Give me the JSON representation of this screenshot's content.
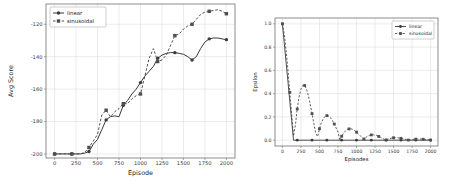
{
  "figure": {
    "background": "#ffffff",
    "grid_color": "#d9d9d9",
    "spine_color": "#707070",
    "tick_color": "#3a3a3a",
    "label_color": "#222222"
  },
  "chart_data": [
    {
      "name": "avg-score-chart",
      "type": "line",
      "title": "",
      "xlabel": "Episode",
      "ylabel": "Avg Score",
      "xlim": [
        -100,
        2100
      ],
      "ylim": [
        -202.5,
        -107.5
      ],
      "grid": true,
      "legend_position": "upper-left",
      "xticks": [
        0,
        250,
        500,
        750,
        1000,
        1250,
        1500,
        1750,
        2000
      ],
      "xtick_labels": [
        "0",
        "250",
        "500",
        "750",
        "1000",
        "1250",
        "1500",
        "1750",
        "2000"
      ],
      "yticks": [
        -200,
        -180,
        -160,
        -140,
        -120
      ],
      "ytick_labels": [
        "-200",
        "-180",
        "-160",
        "-140",
        "-120"
      ],
      "series": [
        {
          "name": "linear",
          "color": "#3a3a3a",
          "dash": "",
          "marker": "circle",
          "points": [
            [
              0,
              -200
            ],
            [
              50,
              -200
            ],
            [
              100,
              -200
            ],
            [
              150,
              -200
            ],
            [
              200,
              -200
            ],
            [
              250,
              -200
            ],
            [
              300,
              -200
            ],
            [
              350,
              -199.5
            ],
            [
              400,
              -198.5
            ],
            [
              450,
              -194
            ],
            [
              500,
              -191
            ],
            [
              550,
              -185
            ],
            [
              600,
              -179
            ],
            [
              650,
              -177
            ],
            [
              700,
              -176.5
            ],
            [
              750,
              -177
            ],
            [
              800,
              -170
            ],
            [
              850,
              -167
            ],
            [
              900,
              -163
            ],
            [
              950,
              -160
            ],
            [
              1000,
              -156
            ],
            [
              1050,
              -152
            ],
            [
              1100,
              -149
            ],
            [
              1150,
              -146
            ],
            [
              1200,
              -141
            ],
            [
              1250,
              -139
            ],
            [
              1300,
              -138
            ],
            [
              1350,
              -137.5
            ],
            [
              1400,
              -137.5
            ],
            [
              1450,
              -138
            ],
            [
              1500,
              -138.5
            ],
            [
              1550,
              -140
            ],
            [
              1600,
              -142
            ],
            [
              1650,
              -140
            ],
            [
              1700,
              -135
            ],
            [
              1750,
              -131
            ],
            [
              1800,
              -129
            ],
            [
              1850,
              -128.5
            ],
            [
              1900,
              -128.5
            ],
            [
              1950,
              -129
            ],
            [
              2000,
              -129.5
            ]
          ],
          "markers": [
            [
              0,
              -200
            ],
            [
              200,
              -200
            ],
            [
              400,
              -198.5
            ],
            [
              600,
              -179
            ],
            [
              800,
              -170
            ],
            [
              1000,
              -156
            ],
            [
              1200,
              -141
            ],
            [
              1400,
              -137.5
            ],
            [
              1600,
              -142
            ],
            [
              1800,
              -129
            ],
            [
              2000,
              -129.5
            ]
          ]
        },
        {
          "name": "sinusoidal",
          "color": "#4f4f4f",
          "dash": "2.6,1.8",
          "marker": "square",
          "points": [
            [
              0,
              -200
            ],
            [
              50,
              -200
            ],
            [
              100,
              -200
            ],
            [
              150,
              -200
            ],
            [
              200,
              -200
            ],
            [
              250,
              -200
            ],
            [
              300,
              -200
            ],
            [
              350,
              -199
            ],
            [
              400,
              -196
            ],
            [
              450,
              -192
            ],
            [
              500,
              -188
            ],
            [
              550,
              -176
            ],
            [
              600,
              -173
            ],
            [
              650,
              -177
            ],
            [
              700,
              -174
            ],
            [
              750,
              -172
            ],
            [
              800,
              -169
            ],
            [
              850,
              -169
            ],
            [
              900,
              -166
            ],
            [
              950,
              -164
            ],
            [
              1000,
              -163
            ],
            [
              1050,
              -152
            ],
            [
              1100,
              -141
            ],
            [
              1150,
              -135
            ],
            [
              1200,
              -143
            ],
            [
              1250,
              -142
            ],
            [
              1300,
              -139
            ],
            [
              1350,
              -133
            ],
            [
              1400,
              -127
            ],
            [
              1450,
              -126
            ],
            [
              1500,
              -123
            ],
            [
              1550,
              -121
            ],
            [
              1600,
              -120
            ],
            [
              1650,
              -117
            ],
            [
              1700,
              -114
            ],
            [
              1750,
              -112.5
            ],
            [
              1800,
              -112
            ],
            [
              1850,
              -111.5
            ],
            [
              1900,
              -111
            ],
            [
              1950,
              -112
            ],
            [
              2000,
              -113.5
            ]
          ],
          "markers": [
            [
              0,
              -200
            ],
            [
              200,
              -200
            ],
            [
              400,
              -196
            ],
            [
              600,
              -173
            ],
            [
              800,
              -169
            ],
            [
              1000,
              -163
            ],
            [
              1200,
              -143
            ],
            [
              1400,
              -127
            ],
            [
              1600,
              -120
            ],
            [
              1800,
              -112
            ],
            [
              2000,
              -113.5
            ]
          ]
        }
      ]
    },
    {
      "name": "epsilon-chart",
      "type": "line",
      "title": "",
      "xlabel": "Episodes",
      "ylabel": "Epsilon",
      "xlim": [
        -100,
        2100
      ],
      "ylim": [
        -0.05,
        1.05
      ],
      "grid": true,
      "legend_position": "upper-right",
      "xticks": [
        0,
        250,
        500,
        750,
        1000,
        1250,
        1500,
        1750,
        2000
      ],
      "xtick_labels": [
        "0",
        "250",
        "500",
        "750",
        "1000",
        "1250",
        "1500",
        "1750",
        "2000"
      ],
      "yticks": [
        0.0,
        0.2,
        0.4,
        0.6,
        0.8,
        1.0
      ],
      "ytick_labels": [
        "0.0",
        "0.2",
        "0.4",
        "0.6",
        "0.8",
        "1.0"
      ],
      "series": [
        {
          "name": "linear",
          "color": "#3a3a3a",
          "dash": "",
          "marker": "circle",
          "points": [
            [
              0,
              1.0
            ],
            [
              25,
              0.833
            ],
            [
              50,
              0.667
            ],
            [
              75,
              0.5
            ],
            [
              100,
              0.333
            ],
            [
              125,
              0.167
            ],
            [
              150,
              0
            ],
            [
              2000,
              0
            ]
          ],
          "markers": [
            [
              0,
              1.0
            ],
            [
              200,
              0
            ],
            [
              400,
              0
            ],
            [
              600,
              0
            ],
            [
              800,
              0
            ],
            [
              1000,
              0
            ],
            [
              1200,
              0
            ],
            [
              1400,
              0
            ],
            [
              1600,
              0
            ],
            [
              1800,
              0
            ],
            [
              2000,
              0
            ]
          ]
        },
        {
          "name": "sinusoidal",
          "color": "#4f4f4f",
          "dash": "2.2,1.6",
          "marker": "square",
          "points": [
            [
              0,
              1.0
            ],
            [
              25,
              0.909
            ],
            [
              50,
              0.771
            ],
            [
              75,
              0.6
            ],
            [
              100,
              0.411
            ],
            [
              125,
              0.22
            ],
            [
              150,
              0.035
            ],
            [
              175,
              0.129
            ],
            [
              200,
              0.268
            ],
            [
              225,
              0.372
            ],
            [
              250,
              0.439
            ],
            [
              275,
              0.472
            ],
            [
              300,
              0.47
            ],
            [
              325,
              0.439
            ],
            [
              350,
              0.384
            ],
            [
              375,
              0.311
            ],
            [
              400,
              0.228
            ],
            [
              425,
              0.142
            ],
            [
              450,
              0.057
            ],
            [
              475,
              0.031
            ],
            [
              500,
              0.099
            ],
            [
              525,
              0.15
            ],
            [
              550,
              0.184
            ],
            [
              575,
              0.204
            ],
            [
              600,
              0.211
            ],
            [
              625,
              0.207
            ],
            [
              650,
              0.192
            ],
            [
              675,
              0.169
            ],
            [
              700,
              0.139
            ],
            [
              725,
              0.105
            ],
            [
              750,
              0.07
            ],
            [
              775,
              0.001
            ],
            [
              800,
              0.034
            ],
            [
              825,
              0.061
            ],
            [
              850,
              0.08
            ],
            [
              875,
              0.092
            ],
            [
              900,
              0.097
            ],
            [
              925,
              0.099
            ],
            [
              950,
              0.092
            ],
            [
              975,
              0.082
            ],
            [
              1000,
              0.069
            ],
            [
              1025,
              0.054
            ],
            [
              1050,
              0.038
            ],
            [
              1075,
              0.022
            ],
            [
              1100,
              0.01
            ],
            [
              1125,
              0.024
            ],
            [
              1150,
              0.034
            ],
            [
              1175,
              0.041
            ],
            [
              1200,
              0.045
            ],
            [
              1225,
              0.046
            ],
            [
              1250,
              0.044
            ],
            [
              1275,
              0.041
            ],
            [
              1300,
              0.032
            ],
            [
              1325,
              0.024
            ],
            [
              1350,
              0.015
            ],
            [
              1375,
              0.007
            ],
            [
              1400,
              0.002
            ],
            [
              1425,
              0.009
            ],
            [
              1450,
              0.014
            ],
            [
              1475,
              0.018
            ],
            [
              1500,
              0.021
            ],
            [
              1525,
              0.021
            ],
            [
              1550,
              0.021
            ],
            [
              1575,
              0.019
            ],
            [
              1600,
              0.016
            ],
            [
              1625,
              0.013
            ],
            [
              1650,
              0.009
            ],
            [
              1675,
              0.005
            ],
            [
              1700,
              0.001
            ],
            [
              1725,
              0.003
            ],
            [
              1750,
              0.006
            ],
            [
              1775,
              0.008
            ],
            [
              1800,
              0.009
            ],
            [
              1825,
              0.01
            ],
            [
              1850,
              0.01
            ],
            [
              1875,
              0.009
            ],
            [
              1900,
              0.008
            ],
            [
              1925,
              0.007
            ],
            [
              1950,
              0.005
            ],
            [
              1975,
              0.003
            ],
            [
              2000,
              0.001
            ]
          ],
          "markers": [
            [
              0,
              1.0
            ],
            [
              100,
              0.411
            ],
            [
              200,
              0.268
            ],
            [
              300,
              0.47
            ],
            [
              400,
              0.228
            ],
            [
              500,
              0.099
            ],
            [
              600,
              0.211
            ],
            [
              700,
              0.139
            ],
            [
              800,
              0.034
            ],
            [
              900,
              0.097
            ],
            [
              1000,
              0.069
            ],
            [
              1100,
              0.01
            ],
            [
              1200,
              0.045
            ],
            [
              1300,
              0.032
            ],
            [
              1400,
              0.002
            ],
            [
              1500,
              0.021
            ],
            [
              1600,
              0.016
            ],
            [
              1700,
              0.001
            ],
            [
              1800,
              0.009
            ],
            [
              1900,
              0.008
            ],
            [
              2000,
              0.001
            ]
          ]
        }
      ]
    }
  ]
}
